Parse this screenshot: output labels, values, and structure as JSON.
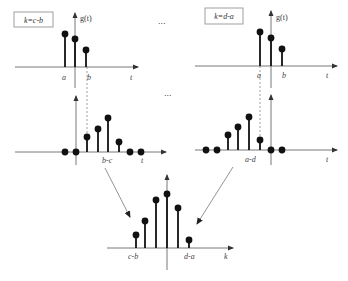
{
  "diagram": {
    "colors": {
      "stem": "#111111",
      "axis": "#555555",
      "dash": "#777777",
      "box_border": "#888888"
    },
    "panels": [
      {
        "id": "top-left",
        "shift_label": "k=c-b",
        "box": [
          14,
          12,
          39,
          15
        ],
        "yaxis": {
          "x": 75,
          "top": 13,
          "bottom": 88,
          "label": "g(t)",
          "label_x": 80,
          "label_y": 21
        },
        "xaxis": {
          "y": 67,
          "left": 15,
          "right": 138
        },
        "stems": [
          {
            "x": 65,
            "y": 34
          },
          {
            "x": 75,
            "y": 39
          },
          {
            "x": 86,
            "y": 50
          }
        ],
        "flat_dots": [],
        "ticks": [
          {
            "text": "a",
            "x": 62,
            "y": 80
          },
          {
            "text": "b",
            "x": 87,
            "y": 80
          },
          {
            "text": "t",
            "x": 130,
            "y": 80
          }
        ]
      },
      {
        "id": "top-right",
        "shift_label": "k=d-a",
        "box": [
          205,
          8,
          38,
          16
        ],
        "yaxis": {
          "x": 271,
          "top": 11,
          "bottom": 88,
          "label": "g(t)",
          "label_x": 276,
          "label_y": 20
        },
        "xaxis": {
          "y": 66,
          "left": 195,
          "right": 337
        },
        "stems": [
          {
            "x": 260,
            "y": 32
          },
          {
            "x": 271,
            "y": 38
          },
          {
            "x": 282,
            "y": 49
          }
        ],
        "flat_dots": [],
        "ticks": [
          {
            "text": "a",
            "x": 257,
            "y": 78
          },
          {
            "text": "b",
            "x": 282,
            "y": 78
          },
          {
            "text": "t",
            "x": 326,
            "y": 78
          }
        ]
      },
      {
        "id": "middle-left",
        "shift_label": "",
        "yaxis": {
          "x": 76,
          "top": 96,
          "bottom": 165,
          "label": "",
          "label_x": 0,
          "label_y": 0
        },
        "xaxis": {
          "y": 152,
          "left": 15,
          "right": 166
        },
        "stems": [
          {
            "x": 87,
            "y": 137
          },
          {
            "x": 98,
            "y": 129
          },
          {
            "x": 108,
            "y": 118
          },
          {
            "x": 119,
            "y": 142
          }
        ],
        "flat_dots": [
          65,
          76,
          130,
          141
        ],
        "ticks": [
          {
            "text": "b-c",
            "x": 102,
            "y": 163
          },
          {
            "text": "t",
            "x": 141,
            "y": 163
          }
        ]
      },
      {
        "id": "middle-right",
        "shift_label": "",
        "yaxis": {
          "x": 271,
          "top": 95,
          "bottom": 165,
          "label": "",
          "label_x": 0,
          "label_y": 0
        },
        "xaxis": {
          "y": 150,
          "left": 195,
          "right": 337
        },
        "stems": [
          {
            "x": 228,
            "y": 135
          },
          {
            "x": 238,
            "y": 127
          },
          {
            "x": 249,
            "y": 117
          },
          {
            "x": 260,
            "y": 140
          }
        ],
        "flat_dots": [
          206,
          217,
          271,
          282
        ],
        "ticks": [
          {
            "text": "a-d",
            "x": 245,
            "y": 162
          },
          {
            "text": "t",
            "x": 326,
            "y": 162
          }
        ]
      },
      {
        "id": "bottom",
        "shift_label": "",
        "yaxis": {
          "x": 167,
          "top": 175,
          "bottom": 270,
          "label": "",
          "label_x": 0,
          "label_y": 0
        },
        "xaxis": {
          "y": 248,
          "left": 107,
          "right": 233
        },
        "stems": [
          {
            "x": 136,
            "y": 235
          },
          {
            "x": 145,
            "y": 221
          },
          {
            "x": 156,
            "y": 200
          },
          {
            "x": 167,
            "y": 194
          },
          {
            "x": 178,
            "y": 208
          },
          {
            "x": 189,
            "y": 240
          }
        ],
        "flat_dots": [],
        "ticks": [
          {
            "text": "c-b",
            "x": 128,
            "y": 259
          },
          {
            "text": "d-a",
            "x": 184,
            "y": 259
          },
          {
            "text": "k",
            "x": 224,
            "y": 259
          }
        ]
      }
    ],
    "dashed_lines": [
      {
        "x1": 87,
        "y1": 67,
        "x2": 87,
        "y2": 136
      },
      {
        "x1": 260,
        "y1": 66,
        "x2": 260,
        "y2": 139
      }
    ],
    "arrows": [
      {
        "x1": 105,
        "y1": 168,
        "x2": 130,
        "y2": 217
      },
      {
        "x1": 233,
        "y1": 167,
        "x2": 197,
        "y2": 224
      }
    ],
    "ellipses": [
      {
        "text": "...",
        "x": 158,
        "y": 24
      },
      {
        "text": "...",
        "x": 164,
        "y": 96
      }
    ]
  }
}
